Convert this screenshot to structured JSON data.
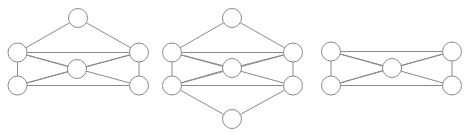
{
  "figure": {
    "title": "",
    "width": 472,
    "height": 136,
    "background_color": "#ffffff",
    "edge_color": "#8a8a8a",
    "node_fill_color": "#ffffff",
    "node_stroke_color": "#8a8a8a",
    "edge_stroke_width": 1,
    "node_radius": 9.5
  },
  "chart_data": {
    "type": "diagram",
    "subtype": "graph-node-link",
    "title": "",
    "xlabel": "",
    "ylabel": "",
    "grid": false,
    "legend": "none",
    "panel_count": 3,
    "panels": [
      {
        "name": "graph-1",
        "index": 0,
        "node_count": 6,
        "edge_count": 10,
        "nodes": [
          {
            "id": "a1",
            "label": "",
            "x": 78,
            "y": 18,
            "r": 9.5,
            "role": "top-apex"
          },
          {
            "id": "b1",
            "label": "",
            "x": 17.5,
            "y": 52.5,
            "r": 9.5,
            "role": "left-upper"
          },
          {
            "id": "c1",
            "label": "",
            "x": 139,
            "y": 52.5,
            "r": 9.5,
            "role": "right-upper"
          },
          {
            "id": "d1",
            "label": "",
            "x": 77,
            "y": 69,
            "r": 9.5,
            "role": "center"
          },
          {
            "id": "e1",
            "label": "",
            "x": 17.5,
            "y": 85.5,
            "r": 9.5,
            "role": "left-lower"
          },
          {
            "id": "f1",
            "label": "",
            "x": 139,
            "y": 85.5,
            "r": 9.5,
            "role": "right-lower"
          }
        ],
        "edges": [
          {
            "source": "a1",
            "target": "b1"
          },
          {
            "source": "a1",
            "target": "c1"
          },
          {
            "source": "b1",
            "target": "c1"
          },
          {
            "source": "b1",
            "target": "d1"
          },
          {
            "source": "b1",
            "target": "e1"
          },
          {
            "source": "b1",
            "target": "f1"
          },
          {
            "source": "c1",
            "target": "d1"
          },
          {
            "source": "c1",
            "target": "e1"
          },
          {
            "source": "c1",
            "target": "f1"
          },
          {
            "source": "d1",
            "target": "e1"
          },
          {
            "source": "e1",
            "target": "f1"
          }
        ]
      },
      {
        "name": "graph-2",
        "index": 1,
        "node_count": 6,
        "edge_count": 12,
        "nodes": [
          {
            "id": "a2",
            "label": "",
            "x": 232,
            "y": 18,
            "r": 9.5,
            "role": "top-apex"
          },
          {
            "id": "b2",
            "label": "",
            "x": 172,
            "y": 52.5,
            "r": 9.5,
            "role": "left-upper"
          },
          {
            "id": "c2",
            "label": "",
            "x": 293,
            "y": 52.5,
            "r": 9.5,
            "role": "right-upper"
          },
          {
            "id": "d2",
            "label": "",
            "x": 232,
            "y": 68,
            "r": 9.5,
            "role": "center"
          },
          {
            "id": "e2",
            "label": "",
            "x": 172,
            "y": 85.5,
            "r": 9.5,
            "role": "left-lower"
          },
          {
            "id": "f2",
            "label": "",
            "x": 293,
            "y": 85.5,
            "r": 9.5,
            "role": "right-lower"
          },
          {
            "id": "g2",
            "label": "",
            "x": 232,
            "y": 119,
            "r": 9.5,
            "role": "bottom-apex"
          }
        ],
        "edges": [
          {
            "source": "a2",
            "target": "b2"
          },
          {
            "source": "a2",
            "target": "c2"
          },
          {
            "source": "b2",
            "target": "c2"
          },
          {
            "source": "b2",
            "target": "d2"
          },
          {
            "source": "b2",
            "target": "e2"
          },
          {
            "source": "b2",
            "target": "f2"
          },
          {
            "source": "c2",
            "target": "d2"
          },
          {
            "source": "c2",
            "target": "e2"
          },
          {
            "source": "c2",
            "target": "f2"
          },
          {
            "source": "d2",
            "target": "e2"
          },
          {
            "source": "e2",
            "target": "f2"
          },
          {
            "source": "e2",
            "target": "g2"
          },
          {
            "source": "f2",
            "target": "g2"
          }
        ]
      },
      {
        "name": "graph-3",
        "index": 2,
        "node_count": 5,
        "edge_count": 8,
        "nodes": [
          {
            "id": "b3",
            "label": "",
            "x": 331,
            "y": 51.5,
            "r": 9.5,
            "role": "left-upper"
          },
          {
            "id": "c3",
            "label": "",
            "x": 452,
            "y": 51.5,
            "r": 9.5,
            "role": "right-upper"
          },
          {
            "id": "d3",
            "label": "",
            "x": 392,
            "y": 68,
            "r": 9.5,
            "role": "center"
          },
          {
            "id": "e3",
            "label": "",
            "x": 331,
            "y": 85.5,
            "r": 9.5,
            "role": "left-lower"
          },
          {
            "id": "f3",
            "label": "",
            "x": 452,
            "y": 85.5,
            "r": 9.5,
            "role": "right-lower"
          }
        ],
        "edges": [
          {
            "source": "b3",
            "target": "c3"
          },
          {
            "source": "b3",
            "target": "d3"
          },
          {
            "source": "b3",
            "target": "e3"
          },
          {
            "source": "b3",
            "target": "f3"
          },
          {
            "source": "c3",
            "target": "d3"
          },
          {
            "source": "c3",
            "target": "e3"
          },
          {
            "source": "c3",
            "target": "f3"
          },
          {
            "source": "d3",
            "target": "e3"
          },
          {
            "source": "e3",
            "target": "f3"
          }
        ]
      }
    ]
  }
}
